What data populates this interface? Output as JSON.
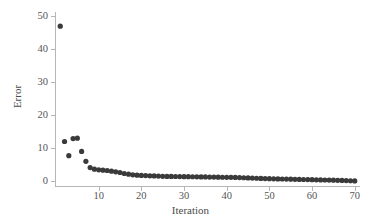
{
  "chart_data": {
    "type": "scatter",
    "title": "",
    "subtitle": "",
    "xlabel": "Iteration",
    "ylabel": "Error",
    "xlim": [
      0,
      71
    ],
    "ylim": [
      -1.5,
      51
    ],
    "xticks": [
      10,
      20,
      30,
      40,
      50,
      60,
      70
    ],
    "yticks": [
      0,
      10,
      20,
      30,
      40,
      50
    ],
    "xtick_labels": [
      "10",
      "20",
      "30",
      "40",
      "50",
      "60",
      "70"
    ],
    "ytick_labels": [
      "0",
      "10",
      "20",
      "30",
      "40",
      "50"
    ],
    "grid": false,
    "legend": null,
    "legend_position": "none",
    "marker": "circle",
    "marker_size": 2.6,
    "marker_color": "#3a3a3a",
    "axis_color": "#b6b6b6",
    "text_color": "#4a4a4a",
    "background_color": "#ffffff",
    "annotations": [],
    "series": [
      {
        "name": "Error",
        "x": [
          1,
          2,
          3,
          4,
          5,
          6,
          7,
          8,
          9,
          10,
          11,
          12,
          13,
          14,
          15,
          16,
          17,
          18,
          19,
          20,
          21,
          22,
          23,
          24,
          25,
          26,
          27,
          28,
          29,
          30,
          31,
          32,
          33,
          34,
          35,
          36,
          37,
          38,
          39,
          40,
          41,
          42,
          43,
          44,
          45,
          46,
          47,
          48,
          49,
          50,
          51,
          52,
          53,
          54,
          55,
          56,
          57,
          58,
          59,
          60,
          61,
          62,
          63,
          64,
          65,
          66,
          67,
          68,
          69,
          70
        ],
        "y": [
          47.0,
          12.0,
          7.7,
          12.9,
          13.0,
          9.0,
          6.0,
          4.1,
          3.6,
          3.4,
          3.3,
          3.2,
          3.0,
          2.8,
          2.6,
          2.3,
          2.1,
          1.9,
          1.8,
          1.7,
          1.65,
          1.6,
          1.55,
          1.5,
          1.45,
          1.42,
          1.4,
          1.38,
          1.36,
          1.34,
          1.32,
          1.3,
          1.28,
          1.26,
          1.24,
          1.22,
          1.2,
          1.18,
          1.16,
          1.14,
          1.12,
          1.1,
          1.05,
          1.0,
          0.95,
          0.9,
          0.85,
          0.8,
          0.76,
          0.72,
          0.68,
          0.65,
          0.62,
          0.59,
          0.56,
          0.53,
          0.5,
          0.47,
          0.44,
          0.41,
          0.38,
          0.35,
          0.32,
          0.29,
          0.26,
          0.23,
          0.19,
          0.15,
          0.1,
          0.05
        ]
      }
    ]
  },
  "axes": {
    "x_title": "Iteration",
    "y_title": "Error"
  }
}
